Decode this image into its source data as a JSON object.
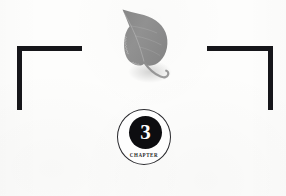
{
  "page": {
    "background_color": "#fdfdfc",
    "width": 286,
    "height": 196
  },
  "decorations": {
    "bracket_left": {
      "name": "top-left corner rule",
      "color": "#16161a"
    },
    "bracket_right": {
      "name": "top-right corner rule",
      "color": "#16161a"
    },
    "leaf": {
      "name": "leaf-illustration",
      "description": "grey cottonwood leaf with curved stem",
      "fill_color": "#8f8f8f",
      "shade_color": "#7d7d7d",
      "stem_color": "#8a8a8a"
    }
  },
  "chapter_badge": {
    "number": "3",
    "label": "CHAPTER",
    "ring_color": "#2a2a2e",
    "disc_color": "#0d0d10",
    "number_color": "#ffffff",
    "label_color": "#272729"
  }
}
